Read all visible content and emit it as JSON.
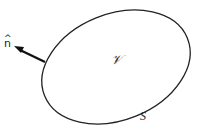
{
  "diagram": {
    "labels": {
      "normal": "n",
      "normal_hat": "^",
      "volume": "𝒱",
      "surface": "S"
    },
    "colors": {
      "stroke": "#222222",
      "background": "#ffffff"
    }
  }
}
